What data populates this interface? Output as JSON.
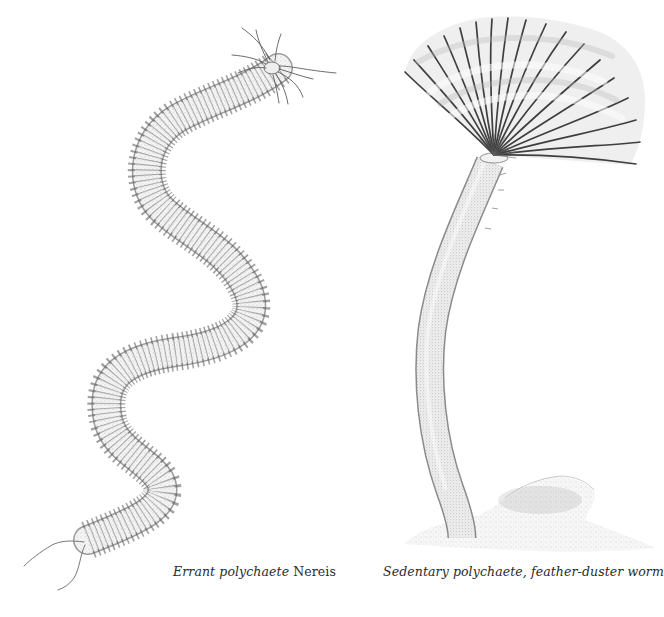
{
  "plate": {
    "background": "#ffffff",
    "ink_color": "#3a3a3a",
    "figures": [
      {
        "id": "errant",
        "subject": "Nereis (ragworm) – long segmented sinuous body with parapodia along both sides, head tentacles top-right, tail cirri bottom-left",
        "caption": {
          "italic_part": "Errant polychaete",
          "roman_part": " Nereis"
        }
      },
      {
        "id": "sedentary",
        "subject": "Feather-duster worm – fan-shaped crown of radioles atop a long curved tube emerging from sediment mound",
        "caption": {
          "italic_part": "Sedentary polychaete, feather-duster worm",
          "roman_part": ""
        }
      }
    ]
  }
}
